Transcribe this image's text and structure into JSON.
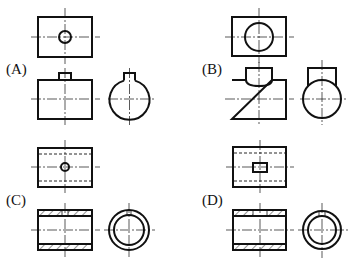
{
  "figure": {
    "options": [
      {
        "id": "A",
        "label": "(A)",
        "views": [
          "top view: rectangle with small circular hole",
          "front view: rectangle with small rectangular boss on top",
          "side view: circle with small boss on top"
        ]
      },
      {
        "id": "B",
        "label": "(B)",
        "views": [
          "top view: rectangle with large circle",
          "front view: rectangle with semicircular saddle on top",
          "side view: circle with rectangular upright"
        ]
      },
      {
        "id": "C",
        "label": "(C)",
        "views": [
          "top view: rectangle with hidden bore lines and small circular hole",
          "front view: sectioned tube with small hole through top wall",
          "side view: concentric circles with hole mark"
        ]
      },
      {
        "id": "D",
        "label": "(D)",
        "views": [
          "top view: rectangle with hidden bore lines and rectangular slot",
          "front view: sectioned tube with rectangular slot through top wall",
          "side view: concentric circles with slot mark"
        ]
      }
    ]
  }
}
